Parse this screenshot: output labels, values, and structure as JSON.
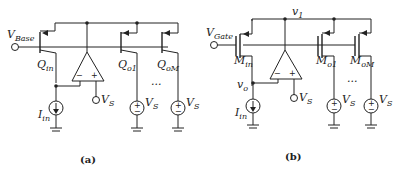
{
  "figure_a": {
    "caption": "(a)",
    "input_label": "V",
    "input_label_sub": "Base",
    "input_transistor": {
      "label": "Q",
      "sub": "in"
    },
    "output_transistors": [
      {
        "label": "Q",
        "sub": "o1"
      },
      {
        "label": "Q",
        "sub": "oM"
      }
    ],
    "ellipsis": "...",
    "current_source": {
      "label": "I",
      "sub": "in"
    },
    "opamp_minus": "−",
    "opamp_plus": "+",
    "vs_label": "V",
    "vs_sub": "S"
  },
  "figure_b": {
    "caption": "(b)",
    "input_label": "V",
    "input_label_sub": "Gate",
    "node_v1": "v",
    "node_v1_sub": "1",
    "node_vo": "v",
    "node_vo_sub": "o",
    "input_transistor": {
      "label": "M",
      "sub": "in"
    },
    "output_transistors": [
      {
        "label": "M",
        "sub": "o1"
      },
      {
        "label": "M",
        "sub": "oM"
      }
    ],
    "ellipsis": "...",
    "current_source": {
      "label": "I",
      "sub": "in"
    },
    "opamp_minus": "−",
    "opamp_plus": "+",
    "vs_label": "V",
    "vs_sub": "S"
  },
  "symbols": {
    "source_plus": "+",
    "source_minus": "−"
  }
}
